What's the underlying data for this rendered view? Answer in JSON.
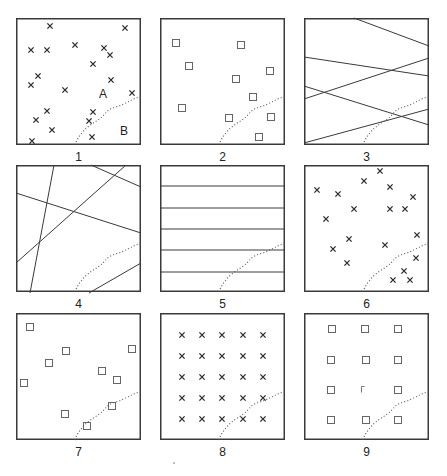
{
  "figure": {
    "colors": {
      "stroke": "#3a3a3a",
      "mark": "#2a2a2a",
      "boundary": "#555555",
      "background": "#ffffff"
    },
    "box": {
      "width": 125,
      "height": 127
    },
    "panels": [
      {
        "id": "1",
        "label": "1",
        "x": 16,
        "y": 18,
        "type": "random-crosses",
        "region_labels": [
          {
            "text": "A",
            "x": 87,
            "y": 80
          },
          {
            "text": "B",
            "x": 108,
            "y": 117
          }
        ],
        "marks": [
          [
            34,
            8
          ],
          [
            109,
            10
          ],
          [
            59,
            27
          ],
          [
            15,
            32
          ],
          [
            31,
            32
          ],
          [
            88,
            30
          ],
          [
            94,
            37
          ],
          [
            77,
            46
          ],
          [
            22,
            58
          ],
          [
            15,
            67
          ],
          [
            95,
            62
          ],
          [
            49,
            72
          ],
          [
            116,
            75
          ],
          [
            31,
            93
          ],
          [
            77,
            94
          ],
          [
            20,
            102
          ],
          [
            73,
            103
          ],
          [
            36,
            112
          ],
          [
            16,
            123
          ],
          [
            76,
            119
          ]
        ]
      },
      {
        "id": "2",
        "label": "2",
        "x": 160,
        "y": 18,
        "type": "random-squares",
        "marks": [
          [
            16,
            25
          ],
          [
            81,
            27
          ],
          [
            29,
            48
          ],
          [
            110,
            53
          ],
          [
            76,
            61
          ],
          [
            93,
            79
          ],
          [
            22,
            90
          ],
          [
            69,
            100
          ],
          [
            111,
            99
          ],
          [
            99,
            119
          ]
        ]
      },
      {
        "id": "3",
        "label": "3",
        "x": 304,
        "y": 18,
        "type": "random-lines",
        "lines": [
          [
            50,
            0,
            125,
            28
          ],
          [
            0,
            39,
            125,
            58
          ],
          [
            0,
            81,
            125,
            40
          ],
          [
            0,
            68,
            125,
            107
          ],
          [
            0,
            125,
            125,
            91
          ]
        ]
      },
      {
        "id": "4",
        "label": "4",
        "x": 16,
        "y": 165,
        "type": "random-lines",
        "lines": [
          [
            38,
            0,
            14,
            128
          ],
          [
            0,
            28,
            125,
            68
          ],
          [
            0,
            98,
            110,
            0
          ],
          [
            75,
            0,
            125,
            22
          ],
          [
            73,
            128,
            125,
            98
          ]
        ]
      },
      {
        "id": "5",
        "label": "5",
        "x": 160,
        "y": 165,
        "type": "parallel-lines",
        "lines": [
          [
            0,
            21,
            125,
            21
          ],
          [
            0,
            43,
            125,
            43
          ],
          [
            0,
            64,
            125,
            64
          ],
          [
            0,
            85,
            125,
            85
          ],
          [
            0,
            107,
            125,
            107
          ]
        ]
      },
      {
        "id": "6",
        "label": "6",
        "x": 304,
        "y": 165,
        "type": "random-crosses",
        "marks": [
          [
            76,
            6
          ],
          [
            60,
            16
          ],
          [
            13,
            25
          ],
          [
            34,
            29
          ],
          [
            86,
            22
          ],
          [
            109,
            32
          ],
          [
            50,
            44
          ],
          [
            86,
            44
          ],
          [
            101,
            44
          ],
          [
            22,
            54
          ],
          [
            113,
            70
          ],
          [
            45,
            74
          ],
          [
            81,
            80
          ],
          [
            29,
            84
          ],
          [
            112,
            93
          ],
          [
            43,
            98
          ],
          [
            100,
            106
          ],
          [
            89,
            115
          ],
          [
            106,
            115
          ]
        ]
      },
      {
        "id": "7",
        "label": "7",
        "x": 16,
        "y": 313,
        "type": "random-squares",
        "marks": [
          [
            14,
            14
          ],
          [
            50,
            38
          ],
          [
            33,
            50
          ],
          [
            116,
            36
          ],
          [
            86,
            58
          ],
          [
            101,
            67
          ],
          [
            8,
            70
          ],
          [
            49,
            101
          ],
          [
            96,
            93
          ],
          [
            71,
            113
          ]
        ]
      },
      {
        "id": "8",
        "label": "8",
        "x": 160,
        "y": 313,
        "type": "regular-crosses",
        "marks": [
          [
            22,
            22
          ],
          [
            42,
            22
          ],
          [
            62,
            22
          ],
          [
            83,
            22
          ],
          [
            103,
            22
          ],
          [
            22,
            43
          ],
          [
            42,
            43
          ],
          [
            62,
            43
          ],
          [
            83,
            43
          ],
          [
            103,
            43
          ],
          [
            22,
            64
          ],
          [
            42,
            64
          ],
          [
            62,
            64
          ],
          [
            83,
            64
          ],
          [
            103,
            64
          ],
          [
            22,
            85
          ],
          [
            42,
            85
          ],
          [
            62,
            85
          ],
          [
            83,
            85
          ],
          [
            103,
            85
          ],
          [
            22,
            106
          ],
          [
            42,
            106
          ],
          [
            62,
            106
          ],
          [
            83,
            106
          ],
          [
            103,
            106
          ]
        ]
      },
      {
        "id": "9",
        "label": "9",
        "x": 304,
        "y": 313,
        "type": "regular-squares",
        "marks": [
          [
            28,
            16
          ],
          [
            61,
            16
          ],
          [
            94,
            16
          ],
          [
            27,
            47
          ],
          [
            62,
            47
          ],
          [
            94,
            47
          ],
          [
            27,
            77
          ],
          [
            61,
            77
          ],
          [
            94,
            77
          ],
          [
            27,
            107
          ],
          [
            62,
            107
          ],
          [
            94,
            107
          ]
        ],
        "broken_mark_index": 7
      }
    ]
  }
}
